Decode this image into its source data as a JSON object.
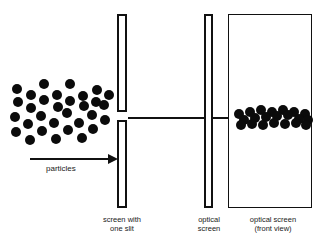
{
  "figure": {
    "background_color": "#ffffff",
    "ink_color": "#111111",
    "dot_color": "#0b0b0b",
    "width": 322,
    "height": 246
  },
  "labels": {
    "particles": "particles",
    "screen_with_one_slit": "screen with\none slit",
    "optical_screen": "optical\nscreen",
    "optical_screen_front_view": "optical screen\n(front view)"
  },
  "elements": {
    "beam_axis": {
      "x": 128,
      "y": 117,
      "width": 184,
      "height": 1.5
    },
    "arrow": {
      "x": 30,
      "y": 158,
      "length": 78
    },
    "slit_bar_top": {
      "x": 117,
      "y": 14,
      "width": 10,
      "height": 98
    },
    "slit_bar_bottom": {
      "x": 117,
      "y": 120,
      "width": 10,
      "height": 88
    },
    "optical_screen_bar": {
      "x": 204,
      "y": 14,
      "width": 9,
      "height": 194
    },
    "front_view_box": {
      "x": 228,
      "y": 14,
      "width": 84,
      "height": 194
    }
  },
  "particle_cloud": {
    "dot_radius": 5,
    "count": 31,
    "dots": [
      [
        17,
        89
      ],
      [
        44,
        84
      ],
      [
        70,
        84
      ],
      [
        97,
        90
      ],
      [
        31,
        95
      ],
      [
        57,
        95
      ],
      [
        83,
        96
      ],
      [
        109,
        95
      ],
      [
        18,
        102
      ],
      [
        44,
        100
      ],
      [
        70,
        101
      ],
      [
        96,
        102
      ],
      [
        31,
        108
      ],
      [
        58,
        107
      ],
      [
        84,
        106
      ],
      [
        104,
        105
      ],
      [
        15,
        117
      ],
      [
        41,
        116
      ],
      [
        67,
        113
      ],
      [
        92,
        115
      ],
      [
        28,
        124
      ],
      [
        54,
        123
      ],
      [
        79,
        123
      ],
      [
        105,
        120
      ],
      [
        16,
        132
      ],
      [
        42,
        131
      ],
      [
        68,
        130
      ],
      [
        93,
        129
      ],
      [
        30,
        140
      ],
      [
        56,
        139
      ],
      [
        82,
        138
      ]
    ]
  },
  "impact_pattern": {
    "dot_radius": 5,
    "count": 21,
    "dots": [
      [
        239,
        114
      ],
      [
        250,
        112
      ],
      [
        261,
        110
      ],
      [
        272,
        112
      ],
      [
        283,
        110
      ],
      [
        294,
        112
      ],
      [
        305,
        114
      ],
      [
        244,
        120
      ],
      [
        255,
        118
      ],
      [
        266,
        117
      ],
      [
        277,
        116
      ],
      [
        288,
        115
      ],
      [
        299,
        119
      ],
      [
        308,
        120
      ],
      [
        241,
        125
      ],
      [
        252,
        124
      ],
      [
        263,
        125
      ],
      [
        274,
        123
      ],
      [
        285,
        124
      ],
      [
        296,
        123
      ],
      [
        306,
        125
      ]
    ]
  },
  "captions": [
    {
      "key": "screen_with_one_slit",
      "x": 92,
      "y": 215,
      "width": 60
    },
    {
      "key": "optical_screen",
      "x": 188,
      "y": 215,
      "width": 42
    },
    {
      "key": "optical_screen_front_view",
      "x": 230,
      "y": 215,
      "width": 86
    }
  ]
}
